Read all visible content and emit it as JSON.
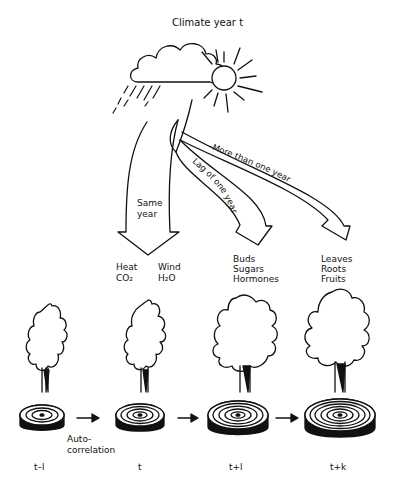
{
  "title": "Climate year t",
  "arrows": [
    {
      "id": "same-year",
      "label_line1": "Same",
      "label_line2": "year"
    },
    {
      "id": "lag-one-year",
      "label": "Lag of one year"
    },
    {
      "id": "more-than-one-year",
      "label": "–More than one year"
    }
  ],
  "factors": {
    "same_year": {
      "col1": [
        "Heat",
        "CO₂"
      ],
      "col2": [
        "Wind",
        "H₂O"
      ]
    },
    "lag_one_year": [
      "Buds",
      "Sugars",
      "Hormones"
    ],
    "more_than_one_year": [
      "Leaves",
      "Roots",
      "Fruits"
    ]
  },
  "autocorrelation_label_line1": "Auto-",
  "autocorrelation_label_line2": "correlation",
  "time_labels": [
    "t–l",
    "t",
    "t+l",
    "t+k"
  ],
  "icons": [
    "cloud-icon",
    "rain-icon",
    "sun-icon",
    "tree-icon",
    "tree-ring-icon",
    "arrow-right-icon"
  ]
}
